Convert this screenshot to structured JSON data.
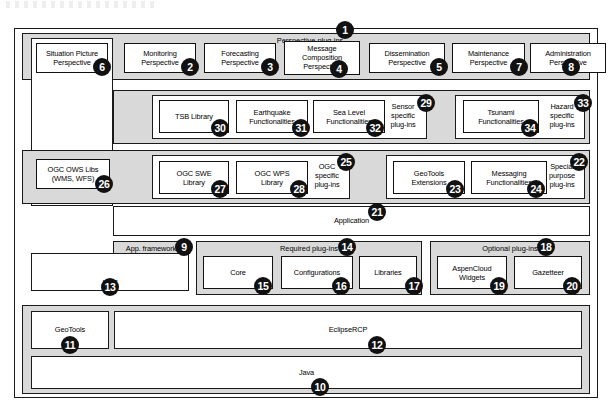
{
  "diagram": {
    "artifact_note": "faint cropped text fragment at top edge"
  },
  "layers": {
    "perspective_band": {
      "title": "Perspective plug-ins",
      "number": "1",
      "items": [
        {
          "label": "Situation Picture\nPerspective",
          "number": "6"
        },
        {
          "label": "Monitoring\nPerspective",
          "number": "2"
        },
        {
          "label": "Forecasting\nPerspective",
          "number": "3"
        },
        {
          "label": "Message\nComposition\nPerspective",
          "number": "4"
        },
        {
          "label": "Dissemination\nPerspective",
          "number": "5"
        },
        {
          "label": "Maintenance\nPerspective",
          "number": "7"
        },
        {
          "label": "Administration\nPerspective",
          "number": "8"
        }
      ]
    },
    "hazard_band": {
      "sensor_group": {
        "label": "Sensor\nspecific\nplug-ins",
        "number": "29"
      },
      "hazard_group": {
        "label": "Hazard\nspecific\nplug-ins",
        "number": "33"
      },
      "items": [
        {
          "label": "TSB Library",
          "number": "30"
        },
        {
          "label": "Earthquake\nFunctionalities",
          "number": "31"
        },
        {
          "label": "Sea Level\nFunctionalities",
          "number": "32"
        },
        {
          "label": "Tsunami\nFunctionalities",
          "number": "34"
        }
      ]
    },
    "ogc_band": {
      "ows_box": {
        "label": "OGC OWS Libs\n(WMS, WFS)",
        "number": "26"
      },
      "ogc_group": {
        "label": "OGC\nspecific\nplug-ins",
        "number": "25"
      },
      "special_group": {
        "label": "Special\npurpose\nplug-ins",
        "number": "22"
      },
      "items": [
        {
          "label": "OGC SWE\nLibrary",
          "number": "27"
        },
        {
          "label": "OGC WPS\nLibrary",
          "number": "28"
        },
        {
          "label": "GeoTools\nExtensions",
          "number": "23"
        },
        {
          "label": "Messaging\nFunctionalities",
          "number": "24"
        }
      ]
    },
    "application": {
      "label": "Application",
      "number": "21"
    },
    "app_framework": {
      "label": "App. framework",
      "number": "9"
    },
    "required_plugins": {
      "title": "Required plug-ins",
      "number": "14",
      "items": [
        {
          "label": "Core",
          "number": "15"
        },
        {
          "label": "Configurations",
          "number": "16"
        },
        {
          "label": "Libraries",
          "number": "17"
        }
      ]
    },
    "optional_plugins": {
      "title": "Optional plug-ins",
      "number": "18",
      "items": [
        {
          "label": "AspenCloud\nWidgets",
          "number": "19"
        },
        {
          "label": "Gazetteer",
          "number": "20"
        }
      ]
    },
    "udig": {
      "label": "uDig",
      "number": "13"
    },
    "geotools": {
      "label": "GeoTools",
      "number": "11"
    },
    "eclipse_rcp": {
      "label": "EclipseRCP",
      "number": "12"
    },
    "java": {
      "label": "Java",
      "number": "10"
    }
  },
  "colors": {
    "band_fill": "#d9d9d9",
    "box_fill": "#ffffff",
    "stroke": "#111111",
    "bullet_fill": "#111111",
    "bullet_text": "#ffffff"
  }
}
